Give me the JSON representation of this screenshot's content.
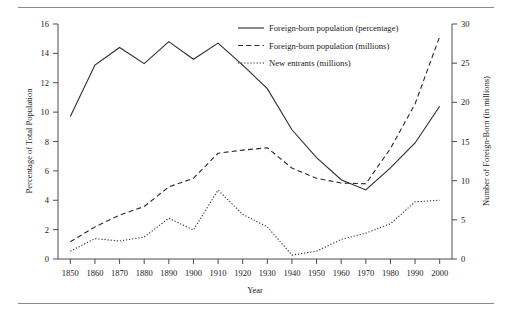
{
  "chart_data": {
    "type": "line",
    "title": "",
    "xlabel": "Year",
    "ylabel": "Percentage of Total Population",
    "y2label": "Number of Foreign-Born (in millions)",
    "x": [
      1850,
      1860,
      1870,
      1880,
      1890,
      1900,
      1910,
      1920,
      1930,
      1940,
      1950,
      1960,
      1970,
      1980,
      1990,
      2000
    ],
    "xlim": [
      1845,
      2005
    ],
    "ylim": [
      0,
      16
    ],
    "y2lim": [
      0,
      30
    ],
    "xticks": [
      "1850",
      "1860",
      "1870",
      "1880",
      "1890",
      "1900",
      "1910",
      "1920",
      "1930",
      "1940",
      "1950",
      "1960",
      "1970",
      "1980",
      "1990",
      "2000"
    ],
    "yticks": [
      "0",
      "2",
      "4",
      "6",
      "8",
      "10",
      "12",
      "14",
      "16"
    ],
    "y2ticks": [
      "0",
      "5",
      "10",
      "15",
      "20",
      "25",
      "30"
    ],
    "grid": false,
    "legend_position": "top-right",
    "series": [
      {
        "name": "Foreign-born population (percentage)",
        "style": "solid",
        "axis": "left",
        "units": "percent",
        "values": [
          9.7,
          13.2,
          14.4,
          13.3,
          14.8,
          13.6,
          14.7,
          13.2,
          11.6,
          8.8,
          6.9,
          5.4,
          4.7,
          6.2,
          7.9,
          10.4
        ]
      },
      {
        "name": "Foreign-born population (millions)",
        "style": "dashed",
        "axis": "right",
        "units": "millions",
        "values": [
          2.2,
          4.1,
          5.6,
          6.7,
          9.2,
          10.3,
          13.5,
          13.9,
          14.2,
          11.6,
          10.3,
          9.7,
          9.6,
          14.1,
          19.8,
          28.4
        ]
      },
      {
        "name": "New entrants (millions)",
        "style": "dotted",
        "axis": "right",
        "units": "millions",
        "values": [
          1.0,
          2.6,
          2.3,
          2.8,
          5.2,
          3.7,
          8.8,
          5.7,
          4.1,
          0.5,
          1.0,
          2.5,
          3.3,
          4.5,
          7.3,
          7.5
        ]
      }
    ]
  },
  "legend": {
    "items": [
      {
        "label": "Foreign-born population (percentage)",
        "style": "solid"
      },
      {
        "label": "Foreign-born population (millions)",
        "style": "dashed"
      },
      {
        "label": "New entrants (millions)",
        "style": "dotted"
      }
    ]
  }
}
